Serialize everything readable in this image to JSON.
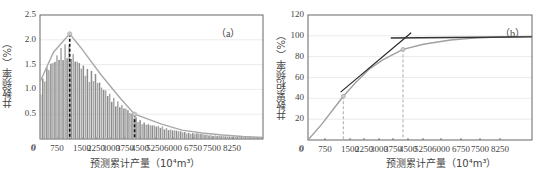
{
  "chart_data": [
    {
      "id": "a",
      "type": "bar",
      "panel_tag": "（a）",
      "title": "",
      "xlabel": "预测累计产量（10⁴m³）",
      "ylabel": "井数频率（%）",
      "ylim": [
        0,
        2.5
      ],
      "xlim": [
        0,
        8250
      ],
      "yticks": [
        "2.5",
        "2.0",
        "1.5",
        "1.0",
        "0.5",
        "0"
      ],
      "xticks": [
        "0",
        "750",
        "1500",
        "2250",
        "3000",
        "3750",
        "4500",
        "5250",
        "6000",
        "6750",
        "7500",
        "8250"
      ],
      "grid": "horizontal",
      "series": [
        {
          "name": "histogram",
          "type": "bar",
          "x": [
            0,
            250,
            500,
            750,
            1000,
            1250,
            1500,
            1750,
            2000,
            2250,
            2500,
            2750,
            3000,
            3250,
            3500,
            3750,
            4000,
            4250,
            4500,
            4750,
            5000,
            5250,
            5500,
            5750,
            6000,
            6250,
            6500,
            6750,
            7000,
            7250,
            7500,
            7750,
            8000,
            8250
          ],
          "values": [
            1.1,
            1.5,
            1.65,
            1.85,
            1.95,
            1.7,
            1.55,
            1.4,
            1.35,
            1.1,
            0.95,
            0.8,
            0.7,
            0.6,
            0.45,
            0.35,
            0.3,
            0.28,
            0.25,
            0.2,
            0.18,
            0.15,
            0.12,
            0.12,
            0.1,
            0.08,
            0.07,
            0.06,
            0.05,
            0.05,
            0.04,
            0.04,
            0.03,
            0.03
          ]
        },
        {
          "name": "fitted curve",
          "type": "line",
          "x": [
            0,
            500,
            1100,
            1500,
            2250,
            3000,
            3500,
            4500,
            5250,
            6000,
            6750,
            7500,
            8250
          ],
          "values": [
            1.15,
            1.75,
            2.12,
            1.85,
            1.3,
            0.8,
            0.5,
            0.3,
            0.18,
            0.12,
            0.08,
            0.05,
            0.03
          ]
        }
      ],
      "annotations": [
        {
          "type": "dashed-vline",
          "x": 1100,
          "y": 2.12,
          "label": "peak"
        },
        {
          "type": "dashed-vline",
          "x": 3500,
          "y": 0.5,
          "label": "inflection"
        }
      ]
    },
    {
      "id": "b",
      "type": "line",
      "panel_tag": "（b）",
      "title": "",
      "xlabel": "预测累计产量（10⁴m³）",
      "ylabel": "井数累积频率（%）",
      "ylim": [
        0,
        120
      ],
      "xlim": [
        0,
        8250
      ],
      "yticks": [
        "120",
        "100",
        "80",
        "60",
        "40",
        "20",
        "0"
      ],
      "xticks": [
        "0",
        "750",
        "1500",
        "2250",
        "3000",
        "3750",
        "4500",
        "5250",
        "6000",
        "6750",
        "7500",
        "8250"
      ],
      "grid": "horizontal",
      "series": [
        {
          "name": "cumulative frequency",
          "type": "line",
          "x": [
            0,
            500,
            1000,
            1300,
            1750,
            2250,
            2750,
            3500,
            4250,
            5250,
            6000,
            6750,
            7500,
            8250
          ],
          "values": [
            0,
            15,
            32,
            42,
            55,
            68,
            77,
            87,
            92,
            96,
            97.5,
            98.5,
            99,
            99.5
          ]
        },
        {
          "name": "tangent line",
          "type": "line",
          "x": [
            1200,
            3800
          ],
          "values": [
            46,
            103
          ]
        },
        {
          "name": "asymptote",
          "type": "line",
          "x": [
            3050,
            8250
          ],
          "values": [
            98,
            99
          ]
        }
      ],
      "annotations": [
        {
          "type": "dashed-vline",
          "x": 1300,
          "y": 42
        },
        {
          "type": "dashed-vline",
          "x": 3500,
          "y": 87
        }
      ]
    }
  ]
}
